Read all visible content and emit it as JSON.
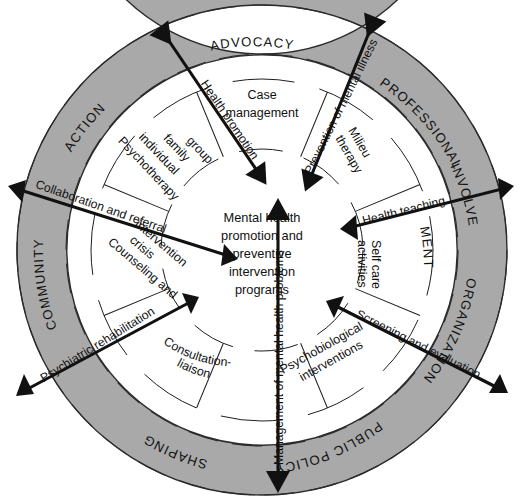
{
  "figure": {
    "colors": {
      "ring_fill": "#a9a9a9",
      "inner_fill": "#ffffff",
      "stroke": "#2b2b2b",
      "arrow": "#111111",
      "text": "#111111",
      "background": "#ffffff"
    }
  },
  "center": {
    "lines": [
      "Mental health",
      "promotion and",
      "preventive",
      "intervention",
      "programs"
    ]
  },
  "outer_ring": {
    "segments": [
      {
        "id": "advocacy",
        "label": "ADVOCACY"
      },
      {
        "id": "professional",
        "label": "PROFESSIONAL"
      },
      {
        "id": "involve",
        "label": "INVOLVE"
      },
      {
        "id": "ment",
        "label": "MENT"
      },
      {
        "id": "organization",
        "label": "ORGANIZATION"
      },
      {
        "id": "public-policy",
        "label": "PUBLIC POLICY"
      },
      {
        "id": "shaping",
        "label": "SHAPING"
      },
      {
        "id": "community",
        "label": "COMMUNITY"
      },
      {
        "id": "action",
        "label": "ACTION"
      }
    ]
  },
  "inner_ring": {
    "segments": [
      {
        "id": "case-management",
        "lines": [
          "Case",
          "management"
        ]
      },
      {
        "id": "milieu-therapy",
        "lines": [
          "Milieu",
          "therapy"
        ]
      },
      {
        "id": "self-care-activities",
        "lines": [
          "Self care",
          "activities"
        ]
      },
      {
        "id": "psychobiological",
        "lines": [
          "Psychobiological",
          "interventions"
        ]
      },
      {
        "id": "consultation-liaison",
        "lines": [
          "Consultation-",
          "liaison"
        ]
      },
      {
        "id": "counseling-crisis",
        "lines": [
          "Counseling and",
          "crisis",
          "intervention"
        ]
      },
      {
        "id": "psychotherapy",
        "lines": [
          "Psychotherapy",
          "individual",
          "family",
          "group"
        ]
      }
    ]
  },
  "arrows": [
    {
      "id": "health-promotion",
      "label": "Health promotion",
      "heads": "inward"
    },
    {
      "id": "prevention-mental-illness",
      "label": "Prevention of mental illness",
      "heads": "outward"
    },
    {
      "id": "health-teaching",
      "label": "Health teaching",
      "heads": "both"
    },
    {
      "id": "screening-evaluation",
      "label": "Screening and evaluation",
      "heads": "both"
    },
    {
      "id": "management-mental-health",
      "label": "Management of mental health problems",
      "heads": "both"
    },
    {
      "id": "psychiatric-rehabilitation",
      "label": "Psychiatric rehabilitation",
      "heads": "both"
    },
    {
      "id": "collaboration-referral",
      "label": "Collaboration and referral",
      "heads": "both"
    }
  ]
}
